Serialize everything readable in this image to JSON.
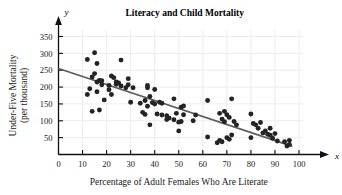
{
  "chart_data": {
    "type": "scatter",
    "title": "Literacy and Child Mortality",
    "xlabel": "Percentage of Adult Females Who Are Literate",
    "ylabel": "Under-Five Mortality (per thousand)",
    "ylabel_line1": "Under-Five Mortality",
    "ylabel_line2": "(per thousand)",
    "x_axis_variable": "x",
    "y_axis_variable": "y",
    "xlim": [
      0,
      100
    ],
    "ylim": [
      0,
      370
    ],
    "xticks": [
      0,
      10,
      20,
      30,
      40,
      50,
      60,
      70,
      80,
      90,
      100
    ],
    "xtick_labels": [
      "0",
      "10",
      "20",
      "30",
      "40",
      "50",
      "60",
      "70",
      "80",
      "90",
      "100"
    ],
    "yticks": [
      50,
      100,
      150,
      200,
      250,
      300,
      350
    ],
    "ytick_labels": [
      "50",
      "100",
      "150",
      "200",
      "250",
      "300",
      "350"
    ],
    "grid": true,
    "grid_color": "#ececec",
    "legend": null,
    "point_color": "#232323",
    "trend_line_color": "#5d5d5d",
    "trend_line": {
      "label": "least-squares regression line",
      "x_start": 0,
      "y_start": 255,
      "x_end": 97,
      "y_end": 25
    },
    "series": [
      {
        "name": "Countries",
        "points": [
          [
            12,
            178
          ],
          [
            12,
            282
          ],
          [
            13,
            195
          ],
          [
            14,
            230
          ],
          [
            14,
            128
          ],
          [
            15,
            302
          ],
          [
            15,
            240
          ],
          [
            16,
            270
          ],
          [
            16,
            215
          ],
          [
            16,
            186
          ],
          [
            17,
            132
          ],
          [
            17,
            220
          ],
          [
            18,
            219
          ],
          [
            18,
            207
          ],
          [
            19,
            162
          ],
          [
            21,
            205
          ],
          [
            21,
            192
          ],
          [
            22,
            233
          ],
          [
            22,
            178
          ],
          [
            23,
            228
          ],
          [
            24,
            215
          ],
          [
            24,
            208
          ],
          [
            25,
            212
          ],
          [
            26,
            280
          ],
          [
            26,
            203
          ],
          [
            28,
            198
          ],
          [
            29,
            225
          ],
          [
            29,
            207
          ],
          [
            30,
            155
          ],
          [
            31,
            198
          ],
          [
            34,
            152
          ],
          [
            35,
            125
          ],
          [
            36,
            160
          ],
          [
            36,
            119
          ],
          [
            37,
            205
          ],
          [
            37,
            198
          ],
          [
            37,
            143
          ],
          [
            38,
            88
          ],
          [
            38,
            172
          ],
          [
            39,
            154
          ],
          [
            40,
            193
          ],
          [
            40,
            150
          ],
          [
            41,
            120
          ],
          [
            42,
            155
          ],
          [
            43,
            152
          ],
          [
            43,
            117
          ],
          [
            45,
            104
          ],
          [
            45,
            115
          ],
          [
            46,
            108
          ],
          [
            48,
            165
          ],
          [
            48,
            103
          ],
          [
            49,
            122
          ],
          [
            50,
            96
          ],
          [
            50,
            70
          ],
          [
            51,
            140
          ],
          [
            51,
            98
          ],
          [
            52,
            144
          ],
          [
            52,
            118
          ],
          [
            56,
            100
          ],
          [
            57,
            117
          ],
          [
            62,
            160
          ],
          [
            62,
            52
          ],
          [
            66,
            35
          ],
          [
            67,
            122
          ],
          [
            67,
            42
          ],
          [
            68,
            105
          ],
          [
            68,
            38
          ],
          [
            69,
            128
          ],
          [
            69,
            97
          ],
          [
            70,
            50
          ],
          [
            70,
            118
          ],
          [
            71,
            110
          ],
          [
            71,
            45
          ],
          [
            72,
            165
          ],
          [
            72,
            58
          ],
          [
            73,
            98
          ],
          [
            74,
            88
          ],
          [
            80,
            120
          ],
          [
            80,
            50
          ],
          [
            81,
            92
          ],
          [
            82,
            88
          ],
          [
            83,
            78
          ],
          [
            84,
            95
          ],
          [
            85,
            64
          ],
          [
            86,
            70
          ],
          [
            87,
            60
          ],
          [
            88,
            78
          ],
          [
            88,
            57
          ],
          [
            89,
            48
          ],
          [
            90,
            62
          ],
          [
            91,
            40
          ],
          [
            94,
            38
          ],
          [
            95,
            25
          ],
          [
            96,
            42
          ],
          [
            96,
            30
          ]
        ]
      }
    ]
  }
}
